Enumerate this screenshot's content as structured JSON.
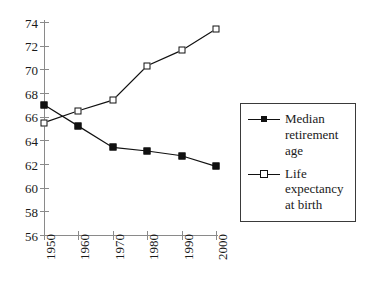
{
  "chart_data": {
    "type": "line",
    "title": "",
    "xlabel": "",
    "ylabel": "",
    "x": [
      1950,
      1960,
      1970,
      1980,
      1990,
      2000
    ],
    "categories": [
      "1950",
      "1960",
      "1970",
      "1980",
      "1990",
      "2000"
    ],
    "xlim": [
      1950,
      2000
    ],
    "ylim": [
      56,
      74
    ],
    "ytick_labels": [
      "74",
      "72",
      "70",
      "68",
      "66",
      "64",
      "62",
      "60",
      "58",
      "56"
    ],
    "ytick_values": [
      74,
      72,
      70,
      68,
      66,
      64,
      62,
      60,
      58,
      56
    ],
    "grid": false,
    "legend_position": "right",
    "series": [
      {
        "name": "Median retirement age",
        "marker": "filled-square",
        "values": [
          67.0,
          65.2,
          63.4,
          63.1,
          62.7,
          61.8
        ]
      },
      {
        "name": "Life expectancy at birth",
        "marker": "open-square",
        "values": [
          65.5,
          66.5,
          67.4,
          70.3,
          71.6,
          73.4
        ]
      }
    ]
  },
  "legend": {
    "entries": [
      {
        "label": "Median retirement age",
        "marker": "filled-square"
      },
      {
        "label": "Life expectancy at birth",
        "marker": "open-square"
      }
    ]
  },
  "colors": {
    "series_line": "#111111",
    "axis": "#8a8a8a",
    "text": "#1a1a1a",
    "legend_border": "#3a3a3a",
    "background": "#ffffff"
  }
}
